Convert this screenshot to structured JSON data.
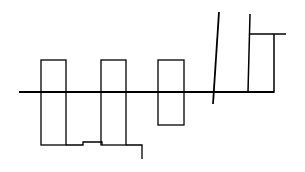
{
  "diagram": {
    "type": "line-sketch",
    "background": "#ffffff",
    "stroke_color": "#000000",
    "main_line": {
      "x1": 19,
      "y1": 92,
      "x2": 274,
      "y2": 92,
      "width": 2
    },
    "boxes": [
      {
        "name": "box-1",
        "x": 41,
        "y": 60,
        "w": 25,
        "h": 85
      },
      {
        "name": "box-2",
        "x": 101,
        "y": 60,
        "w": 25,
        "h": 85
      },
      {
        "name": "box-3",
        "x": 158,
        "y": 60,
        "w": 26,
        "h": 65
      }
    ],
    "bottom_connector": "66,145 83,145 83,142 102,142 102,145",
    "tail_connector": "126,145 142,145 142,159",
    "slanted_line": {
      "x1": 219,
      "y1": 12,
      "x2": 213,
      "y2": 104
    },
    "right_structure": "250,14 248,92 274,92 274,34",
    "right_top_bar": {
      "x1": 250,
      "y1": 34,
      "x2": 286,
      "y2": 34
    }
  }
}
